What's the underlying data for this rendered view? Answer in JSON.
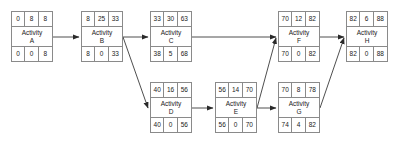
{
  "diagram": {
    "type": "activity-on-node-network",
    "node_layout": {
      "top_row_headers": [
        "early-start",
        "duration",
        "early-finish"
      ],
      "bottom_row_headers": [
        "late-start",
        "slack",
        "late-finish"
      ]
    },
    "nodes": [
      {
        "id": "A",
        "name_line1": "Activity",
        "name_line2": "A",
        "top": [
          "0",
          "8",
          "8"
        ],
        "bottom": [
          "0",
          "0",
          "8"
        ],
        "x": 11,
        "y": 11
      },
      {
        "id": "B",
        "name_line1": "Activity",
        "name_line2": "B",
        "top": [
          "8",
          "25",
          "33"
        ],
        "bottom": [
          "8",
          "0",
          "33"
        ],
        "x": 81,
        "y": 11
      },
      {
        "id": "C",
        "name_line1": "Activity",
        "name_line2": "C",
        "top": [
          "33",
          "30",
          "63"
        ],
        "bottom": [
          "38",
          "5",
          "68"
        ],
        "x": 150,
        "y": 11
      },
      {
        "id": "D",
        "name_line1": "Activity",
        "name_line2": "D",
        "top": [
          "40",
          "16",
          "56"
        ],
        "bottom": [
          "40",
          "0",
          "56"
        ],
        "x": 150,
        "y": 82
      },
      {
        "id": "E",
        "name_line1": "Activity",
        "name_line2": "E",
        "top": [
          "56",
          "14",
          "70"
        ],
        "bottom": [
          "56",
          "0",
          "70"
        ],
        "x": 215,
        "y": 82
      },
      {
        "id": "F",
        "name_line1": "Activity",
        "name_line2": "F",
        "top": [
          "70",
          "12",
          "82"
        ],
        "bottom": [
          "70",
          "0",
          "82"
        ],
        "x": 278,
        "y": 11
      },
      {
        "id": "G",
        "name_line1": "Activity",
        "name_line2": "G",
        "top": [
          "70",
          "8",
          "78"
        ],
        "bottom": [
          "74",
          "4",
          "82"
        ],
        "x": 278,
        "y": 82
      },
      {
        "id": "H",
        "name_line1": "Activity",
        "name_line2": "H",
        "top": [
          "82",
          "6",
          "88"
        ],
        "bottom": [
          "82",
          "0",
          "88"
        ],
        "x": 346,
        "y": 11
      }
    ],
    "edges": [
      {
        "from": "A",
        "to": "B",
        "path": "M 53 37 L 79 37"
      },
      {
        "from": "B",
        "to": "C",
        "path": "M 123 37 L 148 37"
      },
      {
        "from": "B",
        "to": "D",
        "path": "M 123 37 L 148 108"
      },
      {
        "from": "C",
        "to": "F",
        "path": "M 192 37 L 276 37"
      },
      {
        "from": "D",
        "to": "E",
        "path": "M 192 108 L 213 108"
      },
      {
        "from": "E",
        "to": "F",
        "path": "M 257 108 L 276 38"
      },
      {
        "from": "E",
        "to": "G",
        "path": "M 257 108 L 276 108"
      },
      {
        "from": "F",
        "to": "H",
        "path": "M 320 37 L 344 37"
      },
      {
        "from": "G",
        "to": "H",
        "path": "M 320 108 L 344 38"
      }
    ],
    "colors": {
      "border": "#8a8a8a",
      "text": "#1a1a1a",
      "edge": "#3a3a3a",
      "background": "#ffffff"
    }
  }
}
